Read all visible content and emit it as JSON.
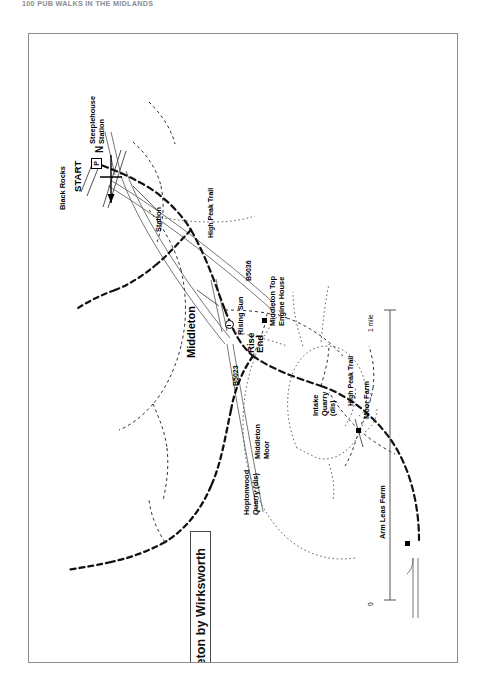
{
  "page": {
    "running_head": "100 PUB WALKS IN THE MIDLANDS"
  },
  "map": {
    "title": "15. Middleton by Wirksworth",
    "compass": {
      "label": "N",
      "icon": "north-arrow-icon"
    },
    "scale": {
      "zero": "0",
      "one_mile": "1 mile"
    },
    "labels": {
      "black_rocks": "Black Rocks",
      "start": "START",
      "parking": "P",
      "steeplehouse_station": "Steeplehouse\nStation",
      "station": "Station",
      "b5036": "B5036",
      "b5023": "B5023",
      "high_peak_trail_north": "High Peak Trail",
      "high_peak_trail_south": "High Peak Trail",
      "middleton": "Middleton",
      "rise_end": "Rise\nEnd",
      "rising_sun": "Rising Sun",
      "middleton_top_engine_house": "Middleton Top\nEngine House",
      "hoptonwood_quarry": "Hoptonwood\nQuarry (dis)",
      "middleton_moor": "Middleton\nMoor",
      "intake_quarry": "Intake\nQuarry\n(dis)",
      "moor_farm": "Moor Farm",
      "arm_leas_farm": "Arm Leas Farm"
    }
  }
}
